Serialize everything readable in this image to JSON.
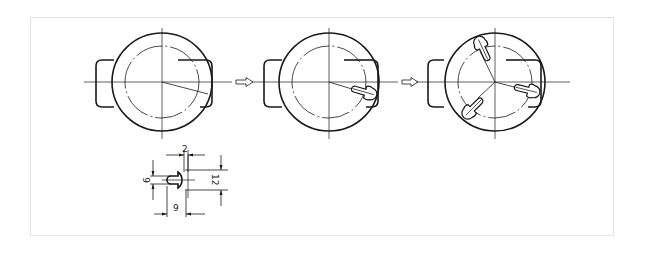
{
  "figure": {
    "stages": [
      {
        "id": "stage-1",
        "label": "Layout of first radial slot line",
        "slots": 0
      },
      {
        "id": "stage-2",
        "label": "First T-slot cut",
        "slots": 1
      },
      {
        "id": "stage-3",
        "label": "Three T-slots at 120 degrees",
        "slots": 3
      }
    ],
    "flow_arrows": [
      "arrow-stage1-to-stage2",
      "arrow-stage2-to-stage3"
    ]
  },
  "detail": {
    "title": "T-slot detail dimensions",
    "dimensions": {
      "top_width": "2",
      "slot_height": "6",
      "head_height": "12",
      "stem_length": "9"
    }
  },
  "colors": {
    "line": "#1a1a1a",
    "frame": "#e2e2e2",
    "background": "#ffffff"
  }
}
